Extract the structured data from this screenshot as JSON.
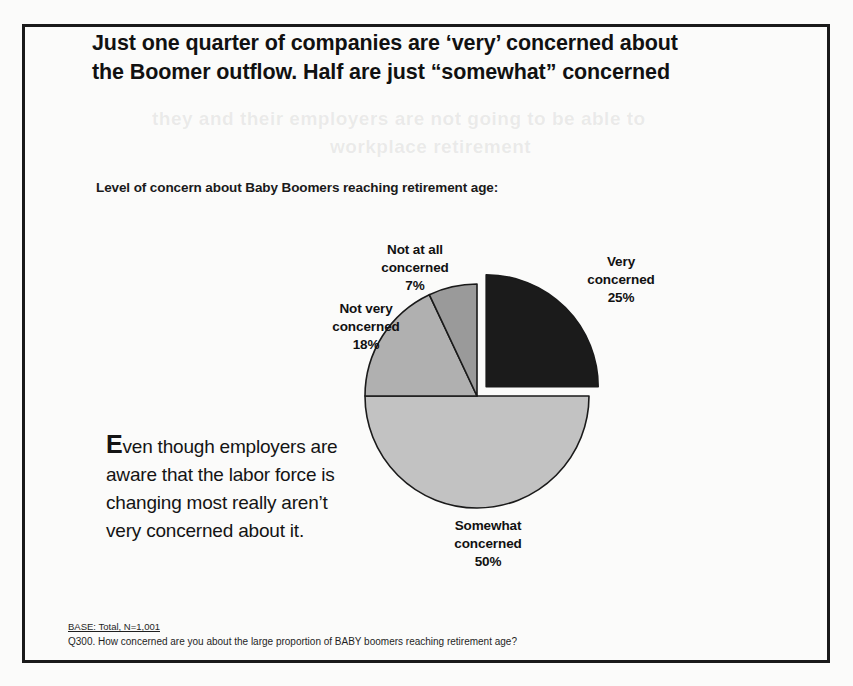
{
  "slide": {
    "title_line1": "Just one quarter of companies are ‘very’ concerned about",
    "title_line2": "the Boomer outflow. Half are just “somewhat” concerned",
    "subtitle": "Level of concern about Baby Boomers reaching retirement age:",
    "commentary_dropcap": "E",
    "commentary_text": "ven though employers are aware that the labor force is changing most really aren’t very concerned about it.",
    "footnote_base": "BASE: Total, N=1,001",
    "footnote_question": "Q300. How concerned are you about the large proportion of BABY boomers reaching retirement age?"
  },
  "chart_data": {
    "type": "pie",
    "title": "Level of concern about Baby Boomers reaching retirement age:",
    "categories": [
      "Very concerned",
      "Somewhat concerned",
      "Not very concerned",
      "Not at all concerned"
    ],
    "values": [
      25,
      50,
      18,
      7
    ],
    "value_labels": [
      "25%",
      "50%",
      "18%",
      "7%"
    ],
    "units": "percent",
    "total": 100,
    "base_n": 1001,
    "legend_position": "none",
    "labels_placement": "outside-callout",
    "start_angle_deg": 0,
    "direction": "clockwise",
    "exploded_slice": "Very concerned",
    "slices": [
      {
        "name": "Very concerned",
        "label_line1": "Very",
        "label_line2": "concerned",
        "value": 25,
        "value_label": "25%",
        "color": "#1b1b1b",
        "start_deg": 0,
        "end_deg": 90,
        "exploded": true
      },
      {
        "name": "Somewhat concerned",
        "label_line1": "Somewhat",
        "label_line2": "concerned",
        "value": 50,
        "value_label": "50%",
        "color": "#c2c2c2",
        "start_deg": 90,
        "end_deg": 270,
        "exploded": false
      },
      {
        "name": "Not very concerned",
        "label_line1": "Not very",
        "label_line2": "concerned",
        "value": 18,
        "value_label": "18%",
        "color": "#b0b0b0",
        "start_deg": 270,
        "end_deg": 334.8,
        "exploded": false
      },
      {
        "name": "Not at all concerned",
        "label_line1": "Not at all",
        "label_line2": "concerned",
        "value": 7,
        "value_label": "7%",
        "color": "#9a9a9a",
        "start_deg": 334.8,
        "end_deg": 360,
        "exploded": false
      }
    ]
  },
  "ghost": {
    "line1": "they and their employers are not going to be able to",
    "line2": "workplace retirement"
  }
}
